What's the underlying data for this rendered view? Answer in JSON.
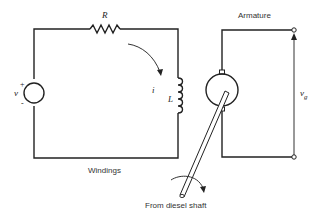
{
  "diagram": {
    "labels": {
      "resistor": "R",
      "current": "i",
      "inductor": "L",
      "source": "v",
      "plus": "+",
      "minus": "-",
      "output_voltage_main": "v",
      "output_voltage_sub": "g",
      "windings": "Windings",
      "armature": "Armature",
      "shaft": "From diesel shaft"
    },
    "components": [
      {
        "type": "voltage-source",
        "label": "v"
      },
      {
        "type": "resistor",
        "label": "R"
      },
      {
        "type": "inductor",
        "label": "L"
      },
      {
        "type": "generator",
        "label": "Armature"
      },
      {
        "type": "terminal-pair",
        "label": "v_g"
      }
    ],
    "colors": {
      "line": "#222222",
      "text": "#333333",
      "background": "#ffffff"
    }
  }
}
